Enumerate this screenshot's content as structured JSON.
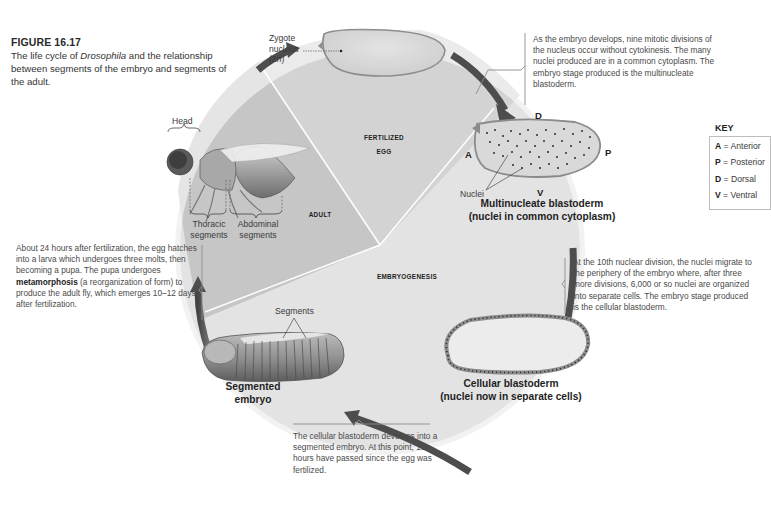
{
  "figure": {
    "number": "FIGURE 16.17",
    "caption_part1": "The life cycle of ",
    "caption_italic": "Drosophila",
    "caption_part2": " and the relationship between segments of the embryo and segments of the adult."
  },
  "sectors": {
    "fertilized_egg_line1": "FERTILIZED",
    "fertilized_egg_line2": "EGG",
    "adult": "ADULT",
    "embryogenesis": "EMBRYOGENESIS"
  },
  "zygote": {
    "label_line1": "Zygote",
    "label_line2": "nucleus",
    "label_line3_pre": "(2",
    "label_line3_italic": "n",
    "label_line3_post": ")"
  },
  "multinucleate": {
    "axis": {
      "dorsal": "D",
      "ventral": "V",
      "anterior": "A",
      "posterior": "P"
    },
    "nuclei_label": "Nuclei",
    "title_line1": "Multinucleate blastoderm",
    "title_line2": "(nuclei in common cytoplasm)",
    "note": "As the embryo develops, nine mitotic divisions of the nucleus occur without cytokinesis. The many nuclei produced are in a common cytoplasm. The embryo stage produced is the multinucleate blastoderm."
  },
  "key": {
    "title": "KEY",
    "items": [
      {
        "letter": "A",
        "meaning": " = Anterior"
      },
      {
        "letter": "P",
        "meaning": " = Posterior"
      },
      {
        "letter": "D",
        "meaning": " = Dorsal"
      },
      {
        "letter": "V",
        "meaning": " = Ventral"
      }
    ]
  },
  "cellular": {
    "title_line1": "Cellular blastoderm",
    "title_line2": "(nuclei now in separate cells)",
    "note": "At the 10th nuclear division, the nuclei migrate to the periphery of the embryo where, after three more divisions, 6,000 or so nuclei are organized into separate cells. The embryo stage produced is the cellular blastoderm."
  },
  "segmented": {
    "segments_label": "Segments",
    "title_line1": "Segmented",
    "title_line2": "embryo",
    "note": "The cellular blastoderm develops into a segmented embryo. At this point, 10 hours have passed since the egg was fertilized."
  },
  "adult": {
    "head_label": "Head",
    "thoracic_line1": "Thoracic",
    "thoracic_line2": "segments",
    "abdominal_line1": "Abdominal",
    "abdominal_line2": "segments",
    "note_part1": "About 24 hours after fertilization, the egg hatches into a larva which undergoes three molts, then becoming a pupa. The pupa undergoes ",
    "note_bold": "metamorphosis",
    "note_part2": " (a reorganization of form) to produce the adult fly, which emerges 10–12 days after fertilization."
  },
  "colors": {
    "arrow": "#4a4a4a",
    "sector_egg": "#d4d4d4",
    "sector_adult": "#c4c4c4",
    "sector_embryo": "#e8e8e8",
    "egg_fill": "#d9d9d9",
    "egg_outline": "#9a9a9a",
    "note_bracket": "#8c8c8c"
  }
}
